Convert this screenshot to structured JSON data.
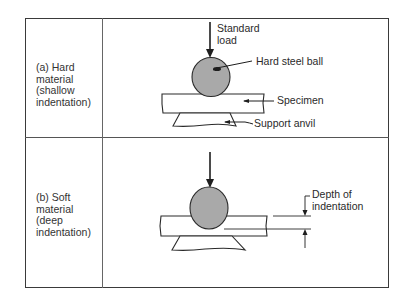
{
  "figure": {
    "rows": [
      {
        "id": "a",
        "label": "(a) Hard\nmaterial\n(shallow\nindentation)",
        "callouts": {
          "load": "Standard\nload",
          "ball": "Hard steel ball",
          "specimen": "Specimen",
          "anvil": "Support anvil"
        }
      },
      {
        "id": "b",
        "label": "(b) Soft\nmaterial\n(deep\nindentation)",
        "callouts": {
          "depth": "Depth of\nindentation"
        }
      }
    ],
    "colors": {
      "ball_fill": "#a9a9a9",
      "line": "#2a2a2a",
      "frame": "#3a3a3a",
      "background": "#ffffff"
    }
  }
}
